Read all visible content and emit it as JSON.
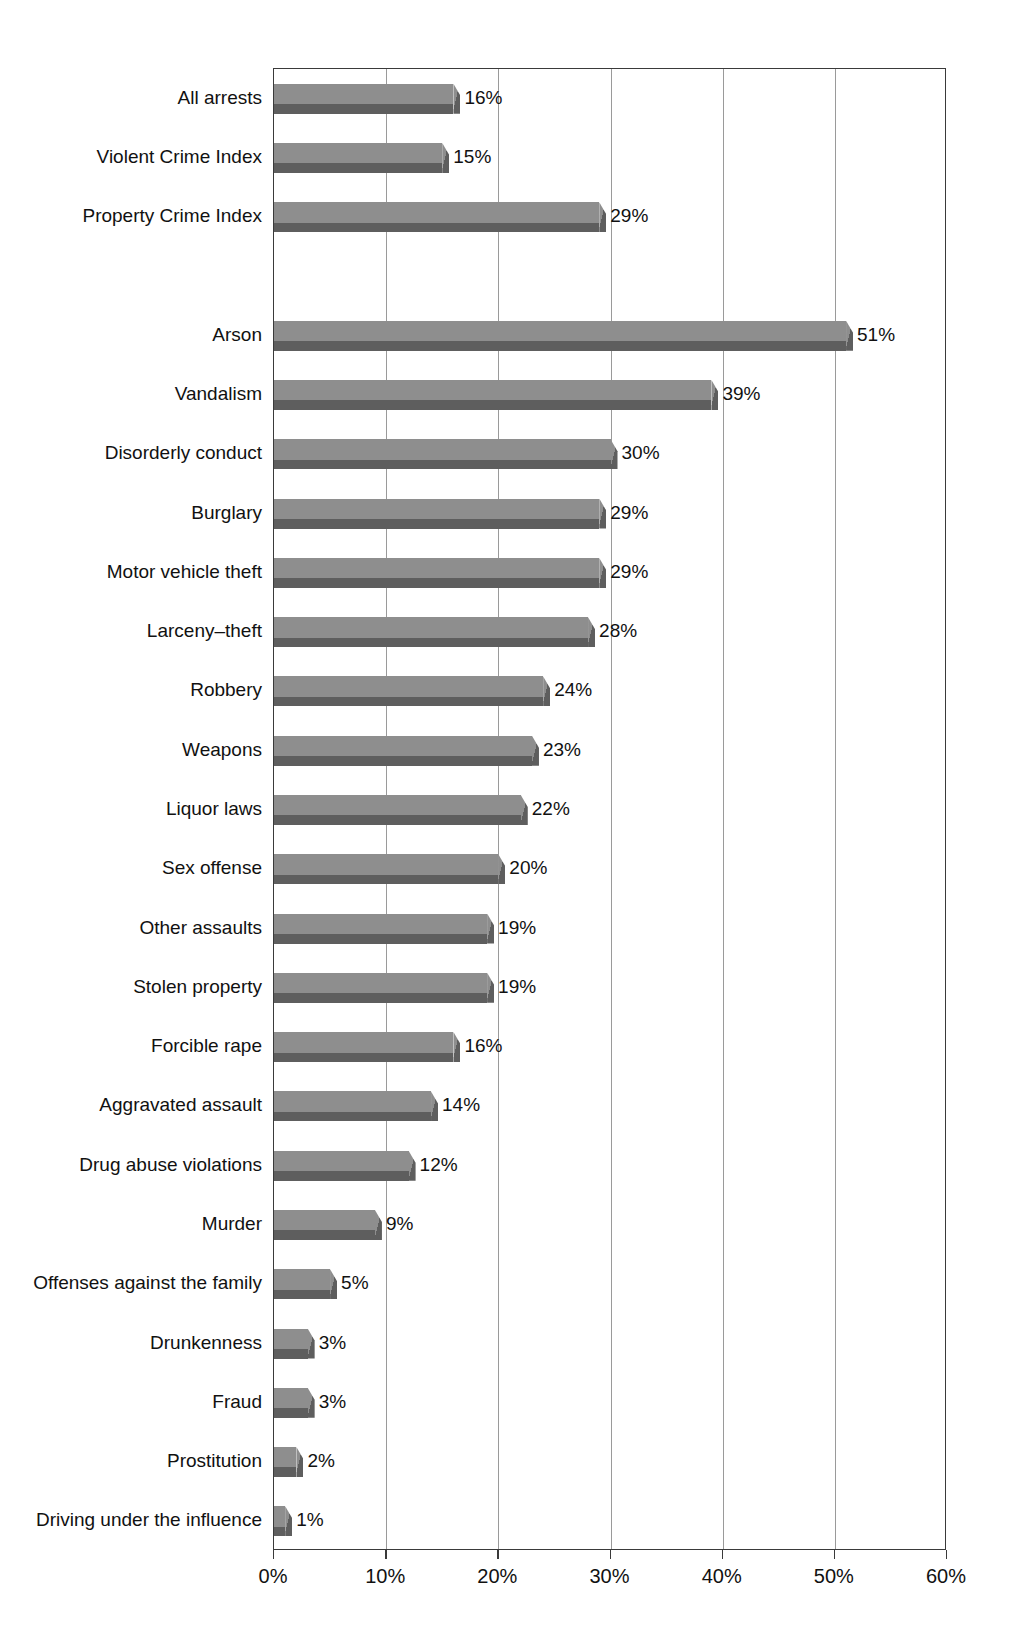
{
  "chart_data": {
    "type": "bar",
    "orientation": "horizontal",
    "title": "",
    "subtitle": "",
    "xlabel": "",
    "ylabel": "",
    "xlim": [
      0,
      60
    ],
    "xtick_labels": [
      "0%",
      "10%",
      "20%",
      "30%",
      "40%",
      "50%",
      "60%"
    ],
    "xtick_values": [
      0,
      10,
      20,
      30,
      40,
      50,
      60
    ],
    "grid": "vertical",
    "legend": "none",
    "value_label_suffix": "%",
    "categories": [
      "All arrests",
      "Violent Crime Index",
      "Property Crime Index",
      "",
      "Arson",
      "Vandalism",
      "Disorderly conduct",
      "Burglary",
      "Motor vehicle theft",
      "Larceny–theft",
      "Robbery",
      "Weapons",
      "Liquor laws",
      "Sex offense",
      "Other assaults",
      "Stolen property",
      "Forcible rape",
      "Aggravated assault",
      "Drug abuse violations",
      "Murder",
      "Offenses against the family",
      "Drunkenness",
      "Fraud",
      "Prostitution",
      "Driving under the influence"
    ],
    "values": [
      16,
      15,
      29,
      null,
      51,
      39,
      30,
      29,
      29,
      28,
      24,
      23,
      22,
      20,
      19,
      19,
      16,
      14,
      12,
      9,
      5,
      3,
      3,
      2,
      1
    ],
    "value_labels": [
      "16%",
      "15%",
      "29%",
      "",
      "51%",
      "39%",
      "30%",
      "29%",
      "29%",
      "28%",
      "24%",
      "23%",
      "22%",
      "20%",
      "19%",
      "19%",
      "16%",
      "14%",
      "12%",
      "9%",
      "5%",
      "3%",
      "3%",
      "2%",
      "1%"
    ],
    "bars": [
      {
        "category": "All arrests",
        "value": 16,
        "label": "16%"
      },
      {
        "category": "Violent Crime Index",
        "value": 15,
        "label": "15%"
      },
      {
        "category": "Property Crime Index",
        "value": 29,
        "label": "29%"
      },
      {
        "category": "",
        "value": null,
        "label": ""
      },
      {
        "category": "Arson",
        "value": 51,
        "label": "51%"
      },
      {
        "category": "Vandalism",
        "value": 39,
        "label": "39%"
      },
      {
        "category": "Disorderly conduct",
        "value": 30,
        "label": "30%"
      },
      {
        "category": "Burglary",
        "value": 29,
        "label": "29%"
      },
      {
        "category": "Motor vehicle theft",
        "value": 29,
        "label": "29%"
      },
      {
        "category": "Larceny–theft",
        "value": 28,
        "label": "28%"
      },
      {
        "category": "Robbery",
        "value": 24,
        "label": "24%"
      },
      {
        "category": "Weapons",
        "value": 23,
        "label": "23%"
      },
      {
        "category": "Liquor laws",
        "value": 22,
        "label": "22%"
      },
      {
        "category": "Sex offense",
        "value": 20,
        "label": "20%"
      },
      {
        "category": "Other assaults",
        "value": 19,
        "label": "19%"
      },
      {
        "category": "Stolen property",
        "value": 19,
        "label": "19%"
      },
      {
        "category": "Forcible rape",
        "value": 16,
        "label": "16%"
      },
      {
        "category": "Aggravated assault",
        "value": 14,
        "label": "14%"
      },
      {
        "category": "Drug abuse violations",
        "value": 12,
        "label": "12%"
      },
      {
        "category": "Murder",
        "value": 9,
        "label": "9%"
      },
      {
        "category": "Offenses against the family",
        "value": 5,
        "label": "5%"
      },
      {
        "category": "Drunkenness",
        "value": 3,
        "label": "3%"
      },
      {
        "category": "Fraud",
        "value": 3,
        "label": "3%"
      },
      {
        "category": "Prostitution",
        "value": 2,
        "label": "2%"
      },
      {
        "category": "Driving under the influence",
        "value": 1,
        "label": "1%"
      }
    ]
  },
  "colors": {
    "bar_face": "#8e8e8e",
    "bar_shadow": "#5e5e5e",
    "gridline": "#9a9a9a",
    "axis": "#3a3a3a",
    "text": "#111111",
    "background": "#ffffff"
  }
}
